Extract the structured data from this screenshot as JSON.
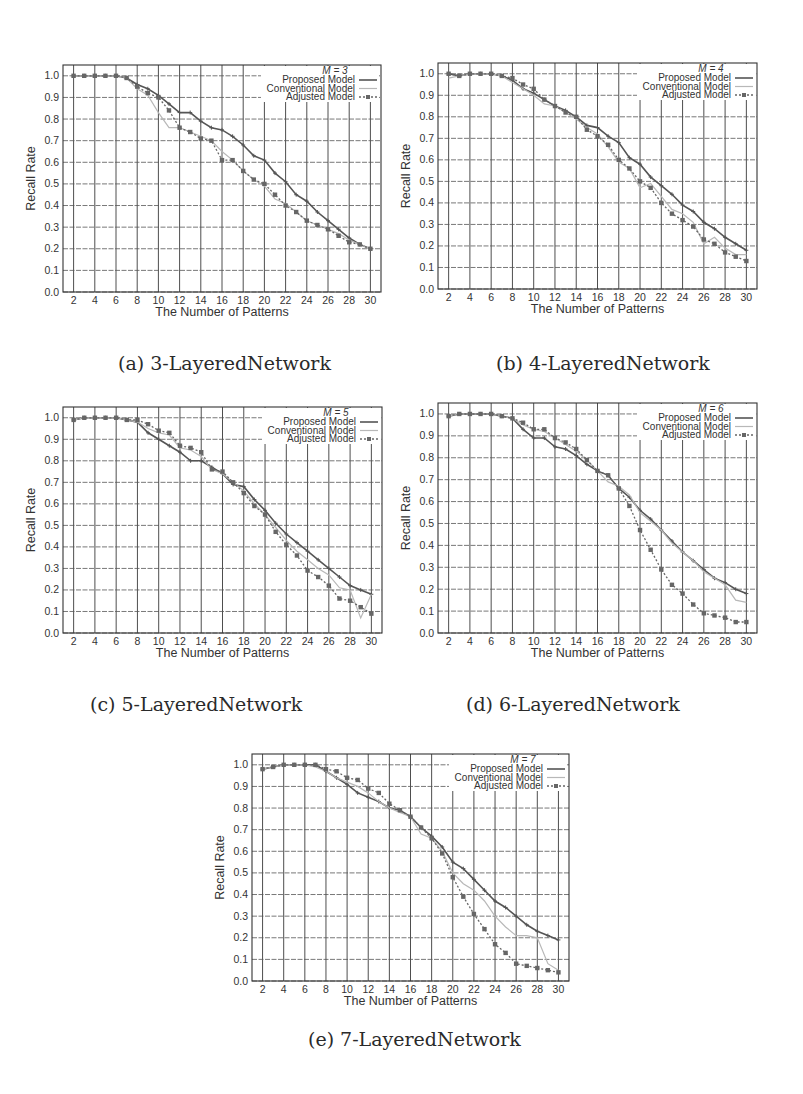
{
  "figure": {
    "legend_labels": [
      "Proposed Model",
      "Conventional Model",
      "Adjusted Model"
    ],
    "series_colors": {
      "proposed": "#555555",
      "conventional": "#b8b8b8",
      "adjusted": "#666666"
    }
  },
  "chart_data": [
    {
      "id": "a",
      "type": "line",
      "caption": "(a) 3-LayeredNetwork",
      "legend_title": "M = 3",
      "title": "",
      "xlabel": "The Number of Patterns",
      "ylabel": "Recall Rate",
      "xlim": [
        1,
        31
      ],
      "ylim": [
        0.0,
        1.05
      ],
      "xticks": [
        2,
        4,
        6,
        8,
        10,
        12,
        14,
        16,
        18,
        20,
        22,
        24,
        26,
        28,
        30
      ],
      "yticks": [
        "0.0",
        "0.1",
        "0.2",
        "0.3",
        "0.4",
        "0.5",
        "0.6",
        "0.7",
        "0.8",
        "0.9",
        "1.0"
      ],
      "grid": true,
      "legend_position": "top-right",
      "x": [
        2,
        3,
        4,
        5,
        6,
        7,
        8,
        9,
        10,
        11,
        12,
        13,
        14,
        15,
        16,
        17,
        18,
        19,
        20,
        21,
        22,
        23,
        24,
        25,
        26,
        27,
        28,
        29,
        30
      ],
      "series": [
        {
          "name": "Proposed Model",
          "values": [
            1.0,
            1.0,
            1.0,
            1.0,
            1.0,
            0.99,
            0.96,
            0.94,
            0.91,
            0.87,
            0.83,
            0.83,
            0.79,
            0.76,
            0.75,
            0.72,
            0.68,
            0.63,
            0.61,
            0.55,
            0.51,
            0.45,
            0.42,
            0.37,
            0.33,
            0.29,
            0.25,
            0.22,
            0.2
          ]
        },
        {
          "name": "Conventional Model",
          "values": [
            1.0,
            1.0,
            1.0,
            1.0,
            1.0,
            0.99,
            0.94,
            0.91,
            0.83,
            0.76,
            0.76,
            0.74,
            0.72,
            0.7,
            0.65,
            0.61,
            0.56,
            0.52,
            0.49,
            0.43,
            0.41,
            0.37,
            0.33,
            0.31,
            0.29,
            0.27,
            0.24,
            0.22,
            0.2
          ]
        },
        {
          "name": "Adjusted Model",
          "values": [
            1.0,
            1.0,
            1.0,
            1.0,
            1.0,
            0.99,
            0.95,
            0.92,
            0.9,
            0.84,
            0.76,
            0.74,
            0.71,
            0.7,
            0.61,
            0.61,
            0.56,
            0.52,
            0.5,
            0.45,
            0.4,
            0.37,
            0.33,
            0.31,
            0.29,
            0.26,
            0.23,
            0.22,
            0.2
          ]
        }
      ]
    },
    {
      "id": "b",
      "type": "line",
      "caption": "(b) 4-LayeredNetwork",
      "legend_title": "M = 4",
      "title": "",
      "xlabel": "The Number of Patterns",
      "ylabel": "Recall Rate",
      "xlim": [
        1,
        31
      ],
      "ylim": [
        0.0,
        1.05
      ],
      "xticks": [
        2,
        4,
        6,
        8,
        10,
        12,
        14,
        16,
        18,
        20,
        22,
        24,
        26,
        28,
        30
      ],
      "yticks": [
        "0.0",
        "0.1",
        "0.2",
        "0.3",
        "0.4",
        "0.5",
        "0.6",
        "0.7",
        "0.8",
        "0.9",
        "1.0"
      ],
      "grid": true,
      "legend_position": "top-right",
      "x": [
        2,
        3,
        4,
        5,
        6,
        7,
        8,
        9,
        10,
        11,
        12,
        13,
        14,
        15,
        16,
        17,
        18,
        19,
        20,
        21,
        22,
        23,
        24,
        25,
        26,
        27,
        28,
        29,
        30
      ],
      "series": [
        {
          "name": "Proposed Model",
          "values": [
            1.0,
            0.99,
            1.0,
            1.0,
            1.0,
            0.99,
            0.97,
            0.93,
            0.91,
            0.88,
            0.85,
            0.83,
            0.8,
            0.76,
            0.75,
            0.71,
            0.68,
            0.61,
            0.58,
            0.52,
            0.48,
            0.44,
            0.39,
            0.36,
            0.31,
            0.28,
            0.24,
            0.21,
            0.18
          ]
        },
        {
          "name": "Conventional Model",
          "values": [
            0.98,
            0.99,
            1.0,
            1.0,
            1.0,
            0.99,
            0.96,
            0.93,
            0.9,
            0.86,
            0.85,
            0.82,
            0.79,
            0.75,
            0.72,
            0.66,
            0.59,
            0.56,
            0.47,
            0.49,
            0.43,
            0.37,
            0.35,
            0.31,
            0.21,
            0.24,
            0.19,
            0.16,
            0.16
          ]
        },
        {
          "name": "Adjusted Model",
          "values": [
            1.0,
            0.99,
            1.0,
            1.0,
            1.0,
            0.99,
            0.98,
            0.95,
            0.93,
            0.88,
            0.85,
            0.82,
            0.8,
            0.74,
            0.71,
            0.67,
            0.6,
            0.56,
            0.5,
            0.47,
            0.4,
            0.35,
            0.32,
            0.29,
            0.23,
            0.21,
            0.17,
            0.15,
            0.13
          ]
        }
      ]
    },
    {
      "id": "c",
      "type": "line",
      "caption": "(c) 5-LayeredNetwork",
      "legend_title": "M = 5",
      "title": "",
      "xlabel": "The Number of Patterns",
      "ylabel": "Recall Rate",
      "xlim": [
        1,
        31
      ],
      "ylim": [
        0.0,
        1.05
      ],
      "xticks": [
        2,
        4,
        6,
        8,
        10,
        12,
        14,
        16,
        18,
        20,
        22,
        24,
        26,
        28,
        30
      ],
      "yticks": [
        "0.0",
        "0.1",
        "0.2",
        "0.3",
        "0.4",
        "0.5",
        "0.6",
        "0.7",
        "0.8",
        "0.9",
        "1.0"
      ],
      "grid": true,
      "legend_position": "top-right",
      "x": [
        2,
        3,
        4,
        5,
        6,
        7,
        8,
        9,
        10,
        11,
        12,
        13,
        14,
        15,
        16,
        17,
        18,
        19,
        20,
        21,
        22,
        23,
        24,
        25,
        26,
        27,
        28,
        29,
        30
      ],
      "series": [
        {
          "name": "Proposed Model",
          "values": [
            0.99,
            1.0,
            1.0,
            1.0,
            1.0,
            0.99,
            0.98,
            0.93,
            0.9,
            0.87,
            0.84,
            0.8,
            0.8,
            0.77,
            0.74,
            0.69,
            0.68,
            0.62,
            0.57,
            0.51,
            0.46,
            0.42,
            0.38,
            0.34,
            0.3,
            0.26,
            0.22,
            0.2,
            0.18
          ]
        },
        {
          "name": "Conventional Model",
          "values": [
            0.99,
            1.0,
            1.0,
            1.0,
            1.0,
            0.99,
            0.98,
            0.95,
            0.93,
            0.92,
            0.86,
            0.85,
            0.82,
            0.76,
            0.74,
            0.7,
            0.66,
            0.6,
            0.55,
            0.49,
            0.43,
            0.38,
            0.34,
            0.3,
            0.27,
            0.21,
            0.2,
            0.07,
            0.18
          ]
        },
        {
          "name": "Adjusted Model",
          "values": [
            0.99,
            1.0,
            1.0,
            1.0,
            1.0,
            0.99,
            0.99,
            0.97,
            0.94,
            0.93,
            0.87,
            0.86,
            0.84,
            0.76,
            0.75,
            0.7,
            0.65,
            0.59,
            0.55,
            0.47,
            0.41,
            0.36,
            0.29,
            0.26,
            0.22,
            0.16,
            0.15,
            0.12,
            0.09
          ]
        }
      ]
    },
    {
      "id": "d",
      "type": "line",
      "caption": "(d) 6-LayeredNetwork",
      "legend_title": "M = 6",
      "title": "",
      "xlabel": "The Number of Patterns",
      "ylabel": "Recall Rate",
      "xlim": [
        1,
        31
      ],
      "ylim": [
        0.0,
        1.05
      ],
      "xticks": [
        2,
        4,
        6,
        8,
        10,
        12,
        14,
        16,
        18,
        20,
        22,
        24,
        26,
        28,
        30
      ],
      "yticks": [
        "0.0",
        "0.1",
        "0.2",
        "0.3",
        "0.4",
        "0.5",
        "0.6",
        "0.7",
        "0.8",
        "0.9",
        "1.0"
      ],
      "grid": true,
      "legend_position": "top-right",
      "x": [
        2,
        3,
        4,
        5,
        6,
        7,
        8,
        9,
        10,
        11,
        12,
        13,
        14,
        15,
        16,
        17,
        18,
        19,
        20,
        21,
        22,
        23,
        24,
        25,
        26,
        27,
        28,
        29,
        30
      ],
      "series": [
        {
          "name": "Proposed Model",
          "values": [
            0.99,
            1.0,
            1.0,
            1.0,
            1.0,
            0.99,
            0.98,
            0.93,
            0.89,
            0.89,
            0.85,
            0.84,
            0.81,
            0.77,
            0.74,
            0.72,
            0.66,
            0.62,
            0.56,
            0.52,
            0.47,
            0.42,
            0.37,
            0.33,
            0.29,
            0.25,
            0.23,
            0.2,
            0.18
          ]
        },
        {
          "name": "Conventional Model",
          "values": [
            0.99,
            1.0,
            1.0,
            1.0,
            1.0,
            0.99,
            0.98,
            0.95,
            0.93,
            0.92,
            0.89,
            0.86,
            0.83,
            0.79,
            0.74,
            0.69,
            0.67,
            0.63,
            0.55,
            0.51,
            0.47,
            0.41,
            0.37,
            0.33,
            0.28,
            0.25,
            0.22,
            0.15,
            0.14
          ]
        },
        {
          "name": "Adjusted Model",
          "values": [
            0.99,
            1.0,
            1.0,
            1.0,
            1.0,
            0.99,
            0.98,
            0.96,
            0.93,
            0.93,
            0.89,
            0.87,
            0.84,
            0.79,
            0.74,
            0.72,
            0.66,
            0.58,
            0.47,
            0.38,
            0.29,
            0.22,
            0.18,
            0.13,
            0.09,
            0.08,
            0.07,
            0.05,
            0.05
          ]
        }
      ]
    },
    {
      "id": "e",
      "type": "line",
      "caption": "(e) 7-LayeredNetwork",
      "legend_title": "M = 7",
      "title": "",
      "xlabel": "The Number of Patterns",
      "ylabel": "Recall Rate",
      "xlim": [
        1,
        31
      ],
      "ylim": [
        0.0,
        1.05
      ],
      "xticks": [
        2,
        4,
        6,
        8,
        10,
        12,
        14,
        16,
        18,
        20,
        22,
        24,
        26,
        28,
        30
      ],
      "yticks": [
        "0.0",
        "0.1",
        "0.2",
        "0.3",
        "0.4",
        "0.5",
        "0.6",
        "0.7",
        "0.8",
        "0.9",
        "1.0"
      ],
      "grid": true,
      "legend_position": "top-right",
      "x": [
        2,
        3,
        4,
        5,
        6,
        7,
        8,
        9,
        10,
        11,
        12,
        13,
        14,
        15,
        16,
        17,
        18,
        19,
        20,
        21,
        22,
        23,
        24,
        25,
        26,
        27,
        28,
        29,
        30
      ],
      "series": [
        {
          "name": "Proposed Model",
          "values": [
            0.98,
            0.99,
            1.0,
            1.0,
            1.0,
            1.0,
            0.97,
            0.94,
            0.91,
            0.87,
            0.85,
            0.83,
            0.8,
            0.79,
            0.76,
            0.71,
            0.67,
            0.62,
            0.55,
            0.52,
            0.47,
            0.42,
            0.37,
            0.34,
            0.3,
            0.26,
            0.23,
            0.21,
            0.19
          ]
        },
        {
          "name": "Conventional Model",
          "values": [
            0.98,
            0.99,
            1.0,
            1.0,
            1.0,
            0.99,
            0.97,
            0.94,
            0.92,
            0.9,
            0.87,
            0.83,
            0.8,
            0.78,
            0.76,
            0.68,
            0.66,
            0.6,
            0.5,
            0.45,
            0.42,
            0.37,
            0.3,
            0.25,
            0.21,
            0.21,
            0.2,
            0.08,
            0.05
          ]
        },
        {
          "name": "Adjusted Model",
          "values": [
            0.98,
            0.99,
            1.0,
            1.0,
            1.0,
            1.0,
            0.98,
            0.97,
            0.94,
            0.93,
            0.89,
            0.87,
            0.82,
            0.79,
            0.76,
            0.71,
            0.66,
            0.59,
            0.48,
            0.39,
            0.31,
            0.24,
            0.17,
            0.13,
            0.08,
            0.07,
            0.06,
            0.05,
            0.04
          ]
        }
      ]
    }
  ]
}
